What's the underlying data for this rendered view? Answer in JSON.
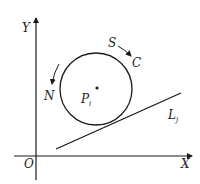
{
  "diagram": {
    "type": "geometry",
    "axes": {
      "x_label": "X",
      "y_label": "Y",
      "origin_label": "O"
    },
    "circle": {
      "center_label": "P",
      "center_subscript": "i",
      "arrow_labels": {
        "top_start": "S",
        "top_end": "C",
        "left": "N"
      }
    },
    "line": {
      "label": "L",
      "subscript": "j"
    },
    "colors": {
      "stroke": "#1a1a1a",
      "background": "#ffffff"
    }
  }
}
